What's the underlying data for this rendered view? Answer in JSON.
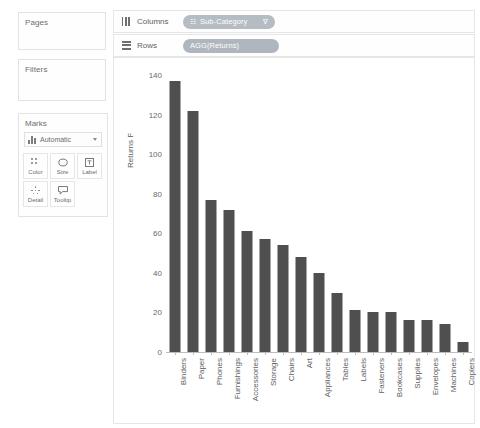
{
  "left_panel": {
    "pages_label": "Pages",
    "filters_label": "Filters",
    "marks_label": "Marks",
    "mark_type": {
      "icon": "bar-chart-icon",
      "value": "Automatic",
      "caret": "chevron-down-icon"
    },
    "mark_buttons": [
      {
        "label": "Color",
        "icon": "color-dots-icon"
      },
      {
        "label": "Size",
        "icon": "size-icon"
      },
      {
        "label": "Label",
        "icon": "label-icon"
      },
      {
        "label": "Detail",
        "icon": "detail-dots-icon"
      },
      {
        "label": "Tooltip",
        "icon": "tooltip-icon"
      }
    ]
  },
  "shelves": {
    "columns": {
      "name": "Columns",
      "icon": "columns-icon",
      "pill": {
        "prefix": "☷",
        "text": "Sub-Category",
        "filter_glyph": "∇"
      }
    },
    "rows": {
      "name": "Rows",
      "icon": "rows-icon",
      "pill": {
        "prefix": "",
        "text": "AGG(Returns)",
        "filter_glyph": ""
      }
    }
  },
  "chart_data": {
    "type": "bar",
    "title": "",
    "xlabel": "",
    "ylabel": "Returns F",
    "ylim": [
      0,
      140
    ],
    "yticks": [
      0,
      20,
      40,
      60,
      80,
      100,
      120,
      140
    ],
    "grid": false,
    "legend": "none",
    "bar_color": "#4f4f4f",
    "categories": [
      "Binders",
      "Paper",
      "Phones",
      "Furnishings",
      "Accessories",
      "Storage",
      "Chairs",
      "Art",
      "Appliances",
      "Tables",
      "Labels",
      "Fasteners",
      "Bookcases",
      "Supplies",
      "Envelopes",
      "Machines",
      "Copiers"
    ],
    "values": [
      137,
      122,
      77,
      72,
      61,
      57,
      54,
      48,
      40,
      30,
      21,
      20,
      20,
      16,
      16,
      14,
      5
    ]
  }
}
